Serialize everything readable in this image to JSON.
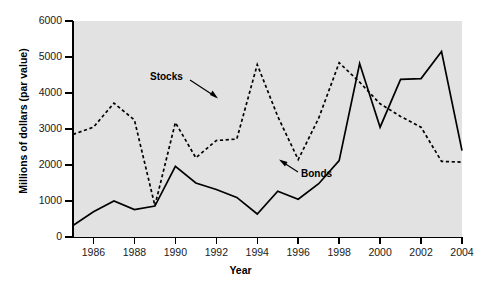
{
  "chart_data": {
    "type": "line",
    "title": "",
    "xlabel": "Year",
    "ylabel": "Millions of dollars (par value)",
    "xlim": [
      1985,
      2004
    ],
    "ylim": [
      0,
      6000
    ],
    "grid": false,
    "legend": "inline-annotations",
    "x": [
      1985,
      1986,
      1987,
      1988,
      1989,
      1990,
      1991,
      1992,
      1993,
      1994,
      1995,
      1996,
      1997,
      1998,
      1999,
      2000,
      2001,
      2002,
      2003,
      2004
    ],
    "xticks": [
      1986,
      1988,
      1990,
      1992,
      1994,
      1996,
      1998,
      2000,
      2002,
      2004
    ],
    "xticklabels": [
      "1986",
      "1988",
      "1990",
      "1992",
      "1994",
      "1996",
      "1998",
      "2000",
      "2002",
      "2004"
    ],
    "yticks": [
      0,
      1000,
      2000,
      3000,
      4000,
      5000,
      6000
    ],
    "yticklabels": [
      "0",
      "1000",
      "2000",
      "3000",
      "4000",
      "5000",
      "6000"
    ],
    "series": [
      {
        "name": "Stocks",
        "style": "dashed",
        "color": "#000000",
        "values": [
          2850,
          3050,
          3720,
          3250,
          870,
          3180,
          2200,
          2680,
          2720,
          4790,
          3350,
          2150,
          3300,
          4840,
          4300,
          3700,
          3350,
          3050,
          2100,
          2080
        ]
      },
      {
        "name": "Bonds",
        "style": "solid",
        "color": "#000000",
        "values": [
          320,
          700,
          1000,
          760,
          860,
          1960,
          1500,
          1320,
          1100,
          640,
          1270,
          1050,
          1480,
          2120,
          4820,
          3050,
          4380,
          4400,
          5150,
          2400
        ]
      }
    ],
    "annotations": [
      {
        "text": "Stocks",
        "series": "Stocks"
      },
      {
        "text": "Bonds",
        "series": "Bonds"
      }
    ]
  },
  "axes": {
    "ylabel": "Millions of dollars (par value)",
    "xlabel": "Year"
  }
}
